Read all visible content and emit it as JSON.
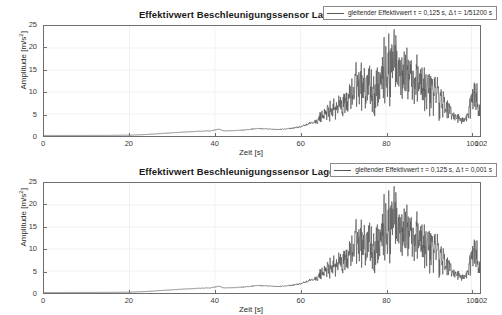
{
  "figure": {
    "background": "#ffffff",
    "line_color": "#555555",
    "axis_color": "#6e6e6e",
    "grid_color": "#e8e8e8"
  },
  "panels": [
    {
      "id": "panel-top",
      "title": "Effektivwert Beschleunigungssensor Lager links",
      "xlabel": "Zeit [s]",
      "ylabel": "Amplitude [m/s",
      "ylabel_sup": "2",
      "ylabel_tail": "]",
      "legend": "gleitender Effektivwert τ = 0,125 s, Δ t = 1/51200 s",
      "yticks": [
        "0",
        "5",
        "10",
        "15",
        "20",
        "25"
      ],
      "xticks": [
        "0",
        "20",
        "40",
        "60",
        "80",
        "100",
        "102"
      ]
    },
    {
      "id": "panel-bottom",
      "title": "Effektivwert Beschleunigungssensor Lager links",
      "xlabel": "Zeit [s]",
      "ylabel": "Amplitude [m/s",
      "ylabel_sup": "2",
      "ylabel_tail": "]",
      "legend": "gleitender Effektivwert τ = 0,125 s, Δ t = 0,001 s",
      "yticks": [
        "0",
        "5",
        "10",
        "15",
        "20",
        "25"
      ],
      "xticks": [
        "0",
        "20",
        "40",
        "60",
        "80",
        "100",
        "102"
      ]
    }
  ],
  "chart_data": [
    {
      "type": "line",
      "title": "Effektivwert Beschleunigungssensor Lager links",
      "xlabel": "Zeit [s]",
      "ylabel": "Amplitude [m/s^2]",
      "xlim": [
        0,
        102
      ],
      "ylim": [
        0,
        25
      ],
      "xticks": [
        0,
        20,
        40,
        60,
        80,
        100,
        102
      ],
      "yticks": [
        0,
        5,
        10,
        15,
        20,
        25
      ],
      "grid": true,
      "legend_position": "upper right",
      "series": [
        {
          "name": "gleitender Effektivwert τ = 0,125 s, Δ t = 1/51200 s",
          "color": "#555555",
          "noise_seed": 1337,
          "noise_scale": 1.0,
          "x": [
            0,
            5,
            10,
            15,
            20,
            24,
            28,
            32,
            36,
            39,
            41,
            42,
            44,
            47,
            50,
            52,
            55,
            58,
            60,
            62,
            64,
            65,
            66,
            67,
            68,
            70,
            72,
            73,
            74,
            75,
            76,
            77,
            78,
            79,
            80,
            81,
            82,
            83,
            84,
            85,
            86,
            87,
            88,
            89,
            90,
            91,
            92,
            93,
            94,
            95,
            96,
            97,
            98,
            99,
            100,
            100.7,
            101.5,
            103,
            105,
            108,
            112,
            115,
            116,
            118,
            120,
            122
          ],
          "y": [
            0.12,
            0.12,
            0.13,
            0.14,
            0.18,
            0.35,
            0.6,
            0.85,
            1.05,
            1.2,
            1.55,
            1.15,
            1.2,
            1.4,
            1.7,
            1.6,
            1.5,
            1.75,
            2.1,
            2.7,
            3.4,
            4.6,
            5.0,
            6.5,
            6.4,
            7.2,
            9.5,
            12.0,
            11.0,
            10.5,
            11.5,
            9.0,
            11.0,
            13.0,
            14.5,
            15.5,
            19.0,
            14.0,
            16.5,
            13.0,
            13.5,
            12.0,
            12.5,
            10.5,
            11.0,
            10.0,
            9.5,
            8.0,
            7.0,
            5.5,
            4.5,
            4.0,
            3.5,
            4.5,
            7.5,
            11.5,
            7.0,
            3.0,
            2.0,
            1.5,
            1.15,
            1.05,
            1.2,
            1.1,
            1.0,
            0.95
          ],
          "peak_value": 21.5,
          "peak_time": 82,
          "baseline_value": 0.12
        }
      ]
    },
    {
      "type": "line",
      "title": "Effektivwert Beschleunigungssensor Lager links",
      "xlabel": "Zeit [s]",
      "ylabel": "Amplitude [m/s^2]",
      "xlim": [
        0,
        102
      ],
      "ylim": [
        0,
        25
      ],
      "xticks": [
        0,
        20,
        40,
        60,
        80,
        100,
        102
      ],
      "yticks": [
        0,
        5,
        10,
        15,
        20,
        25
      ],
      "grid": true,
      "legend_position": "upper right",
      "series": [
        {
          "name": "gleitender Effektivwert τ = 0,125 s, Δ t = 0,001 s",
          "color": "#555555",
          "noise_seed": 1337,
          "noise_scale": 1.0,
          "x": [
            0,
            5,
            10,
            15,
            20,
            24,
            28,
            32,
            36,
            39,
            41,
            42,
            44,
            47,
            50,
            52,
            55,
            58,
            60,
            62,
            64,
            65,
            66,
            67,
            68,
            70,
            72,
            73,
            74,
            75,
            76,
            77,
            78,
            79,
            80,
            81,
            82,
            83,
            84,
            85,
            86,
            87,
            88,
            89,
            90,
            91,
            92,
            93,
            94,
            95,
            96,
            97,
            98,
            99,
            100,
            100.7,
            101.5,
            103,
            105,
            108,
            112,
            115,
            116,
            118,
            120,
            122
          ],
          "y": [
            0.12,
            0.12,
            0.13,
            0.14,
            0.18,
            0.35,
            0.6,
            0.85,
            1.05,
            1.2,
            1.55,
            1.15,
            1.2,
            1.4,
            1.7,
            1.6,
            1.5,
            1.75,
            2.1,
            2.7,
            3.4,
            4.6,
            5.0,
            6.5,
            6.4,
            7.2,
            9.5,
            12.0,
            11.0,
            10.5,
            11.5,
            9.0,
            11.0,
            13.0,
            14.5,
            15.5,
            19.0,
            14.0,
            16.5,
            13.0,
            13.5,
            12.0,
            12.5,
            10.5,
            11.0,
            10.0,
            9.5,
            8.0,
            7.0,
            5.5,
            4.5,
            4.0,
            3.5,
            4.5,
            7.5,
            11.5,
            7.0,
            3.0,
            2.0,
            1.5,
            1.15,
            1.05,
            1.2,
            1.1,
            1.0,
            0.95
          ],
          "peak_value": 21.5,
          "peak_time": 82,
          "baseline_value": 0.12
        }
      ]
    }
  ]
}
